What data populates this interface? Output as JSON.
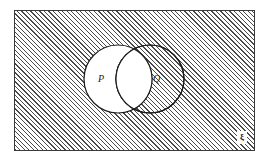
{
  "diagram": {
    "type": "venn",
    "universal_set": {
      "label": "ξ",
      "label_name": "universal-set-symbol",
      "shaded": true,
      "shading": "diagonal-hatch",
      "shading_direction": "45deg-rising",
      "border_color": "#3a3a3a",
      "fill_color": "#ffffff",
      "hatch_color": "#4a4a4a"
    },
    "sets": [
      {
        "id": "P",
        "label": "P",
        "fill_color": "#ffffff",
        "stroke_color": "#1c1c1c",
        "center_x": 118,
        "center_y": 79,
        "radius": 34
      },
      {
        "id": "Q",
        "label": "Q",
        "fill_color": "#ffffff",
        "stroke_color": "#1c1c1c",
        "center_x": 150,
        "center_y": 79,
        "radius": 34
      }
    ],
    "regions": {
      "outside_both_shaded": true,
      "p_only_shaded": false,
      "q_only_shaded": false,
      "intersection_shaded": false
    },
    "shaded_region_meaning": "(P ∪ Q)'"
  }
}
